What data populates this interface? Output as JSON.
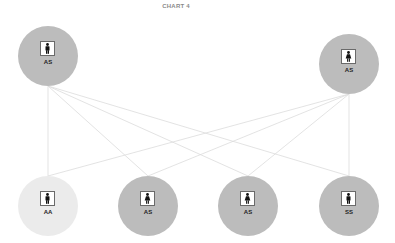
{
  "title": "CHART 4",
  "colors": {
    "node_default": "#bcbcbc",
    "node_light": "#ebebeb",
    "edge": "#dcdcdc",
    "icon": "#111111"
  },
  "nodes": [
    {
      "id": "top-left",
      "label": "AS",
      "icon": "male-person-icon",
      "shade": "default",
      "cx": 48,
      "cy": 56
    },
    {
      "id": "top-right",
      "label": "AS",
      "icon": "female-person-icon",
      "shade": "default",
      "cx": 349,
      "cy": 64
    },
    {
      "id": "bottom-1",
      "label": "AA",
      "icon": "male-person-icon",
      "shade": "light",
      "cx": 48,
      "cy": 206
    },
    {
      "id": "bottom-2",
      "label": "AS",
      "icon": "female-person-icon",
      "shade": "default",
      "cx": 148,
      "cy": 206
    },
    {
      "id": "bottom-3",
      "label": "AS",
      "icon": "female-person-icon",
      "shade": "default",
      "cx": 248,
      "cy": 206
    },
    {
      "id": "bottom-4",
      "label": "SS",
      "icon": "male-person-icon",
      "shade": "default",
      "cx": 349,
      "cy": 206
    }
  ],
  "edges": [
    {
      "from": "top-left",
      "to": "bottom-1"
    },
    {
      "from": "top-left",
      "to": "bottom-2"
    },
    {
      "from": "top-left",
      "to": "bottom-3"
    },
    {
      "from": "top-left",
      "to": "bottom-4"
    },
    {
      "from": "top-right",
      "to": "bottom-1"
    },
    {
      "from": "top-right",
      "to": "bottom-2"
    },
    {
      "from": "top-right",
      "to": "bottom-3"
    },
    {
      "from": "top-right",
      "to": "bottom-4"
    }
  ]
}
